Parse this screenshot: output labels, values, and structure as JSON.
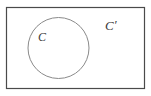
{
  "figure": {
    "type": "venn-diagram",
    "width": 151,
    "height": 96,
    "background_color": "#ffffff"
  },
  "universe": {
    "shape": "rectangle",
    "x": 6,
    "y": 7,
    "width": 139,
    "height": 82,
    "stroke_color": "#4a4a4a",
    "stroke_width": 1.2,
    "fill": "none"
  },
  "set_circle": {
    "shape": "circle",
    "cx": 58.5,
    "cy": 48,
    "r": 30.5,
    "stroke_color": "#8a8a8a",
    "stroke_width": 1,
    "fill": "none"
  },
  "labels": {
    "set": {
      "text": "C",
      "x": 38,
      "y": 41,
      "color": "#3a3a3a"
    },
    "complement": {
      "text": "C",
      "prime": "′",
      "x": 105,
      "y": 30,
      "color": "#3a3a3a"
    }
  }
}
